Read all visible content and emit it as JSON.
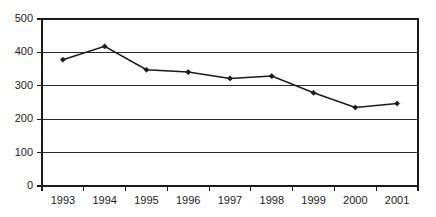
{
  "chart_data": {
    "type": "line",
    "title": "",
    "subtitle": "",
    "xlabel": "",
    "ylabel": "",
    "categories": [
      "1993",
      "1994",
      "1995",
      "1996",
      "1997",
      "1998",
      "1999",
      "2000",
      "2001"
    ],
    "values": [
      378,
      418,
      348,
      341,
      322,
      329,
      279,
      235,
      247
    ],
    "series": [
      {
        "name": "",
        "values": [
          378,
          418,
          348,
          341,
          322,
          329,
          279,
          235,
          247
        ]
      }
    ],
    "ylim": [
      0,
      500
    ],
    "ytick_labels": [
      "0",
      "100",
      "200",
      "300",
      "400",
      "500"
    ],
    "ytick_values": [
      0,
      100,
      200,
      300,
      400,
      500
    ],
    "xtick_labels": [
      "1993",
      "1994",
      "1995",
      "1996",
      "1997",
      "1998",
      "1999",
      "2000",
      "2001"
    ],
    "grid": true,
    "grid_axis": "y",
    "legend": false,
    "legend_position": "none",
    "marker": "diamond",
    "line_color": "#1a1a1a",
    "grid_color": "#2b2b2b",
    "frame_color": "#1a1a1a",
    "background_color": "#ffffff",
    "annotations": []
  }
}
